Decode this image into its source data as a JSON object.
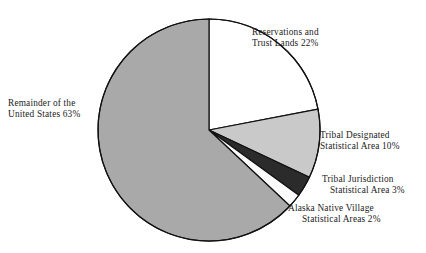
{
  "chart_data": {
    "type": "pie",
    "title": "",
    "subtitle": "",
    "xlabel": "",
    "ylabel": "",
    "legend_position": "none",
    "grid": false,
    "units": "percent",
    "start_angle_deg": 0,
    "direction": "clockwise",
    "categories": [
      "Reservations and Trust Lands",
      "Tribal Designated Statistical Area",
      "Tribal Jurisdiction Statistical Area",
      "Alaska Native Village Statistical Areas",
      "Remainder of the United States"
    ],
    "values": [
      22,
      10,
      3,
      2,
      63
    ],
    "slices": [
      {
        "name": "reservations-and-trust-lands",
        "value": 22,
        "value_text": "22%",
        "label_line1": "Reservations and",
        "label_line2": "Trust Lands 22%",
        "color": "#ffffff"
      },
      {
        "name": "tribal-designated-statistical-area",
        "value": 10,
        "value_text": "10%",
        "label_line1": "Tribal Designated",
        "label_line2": "Statistical Area 10%",
        "color": "#c9c9c9"
      },
      {
        "name": "tribal-jurisdiction-statistical-area",
        "value": 3,
        "value_text": "3%",
        "label_line1": "Tribal Jurisdiction",
        "label_line2": "Statistical Area 3%",
        "color": "#2b2b2b"
      },
      {
        "name": "alaska-native-village-statistical-areas",
        "value": 2,
        "value_text": "2%",
        "label_line1": "Alaska Native Village",
        "label_line2": "Statistical Areas 2%",
        "color": "#fbfbfb"
      },
      {
        "name": "remainder-of-the-united-states",
        "value": 63,
        "value_text": "63%",
        "label_line1": "Remainder of the",
        "label_line2": "United States 63%",
        "color": "#a9a9a9"
      }
    ],
    "style": {
      "background": "#ffffff",
      "outline_color": "#111111",
      "outline_width": 1.2,
      "text_color": "#1b1b1b",
      "center_x": 209,
      "center_y": 130,
      "radius": 111
    }
  }
}
